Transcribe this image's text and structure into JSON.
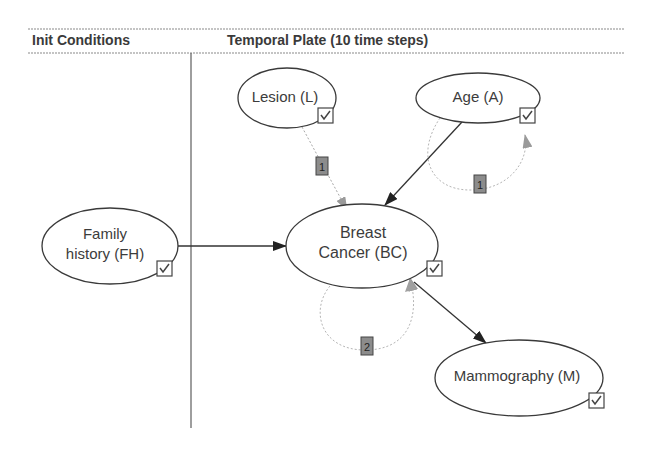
{
  "header": {
    "init_conditions": "Init Conditions",
    "temporal_plate": "Temporal Plate (10 time steps)"
  },
  "nodes": {
    "lesion": {
      "label": "Lesion (L)",
      "checked": true
    },
    "age": {
      "label": "Age (A)",
      "checked": true
    },
    "family_history": {
      "line1": "Family",
      "line2": "history (FH)",
      "checked": true
    },
    "breast_cancer": {
      "line1": "Breast",
      "line2": "Cancer (BC)",
      "checked": true
    },
    "mammography": {
      "label": "Mammography (M)",
      "checked": true
    }
  },
  "arcs": {
    "lesion_to_bc": {
      "from": "Lesion (L)",
      "to": "Breast Cancer (BC)",
      "temporal_order": "1"
    },
    "age_to_bc": {
      "from": "Age (A)",
      "to": "Breast Cancer (BC)"
    },
    "age_self_loop": {
      "from": "Age (A)",
      "to": "Age (A)",
      "temporal_order": "1"
    },
    "fh_to_bc": {
      "from": "Family history (FH)",
      "to": "Breast Cancer (BC)"
    },
    "bc_self_loop": {
      "from": "Breast Cancer (BC)",
      "to": "Breast Cancer (BC)",
      "temporal_order": "2"
    },
    "bc_to_m": {
      "from": "Breast Cancer (BC)",
      "to": "Mammography (M)"
    }
  }
}
